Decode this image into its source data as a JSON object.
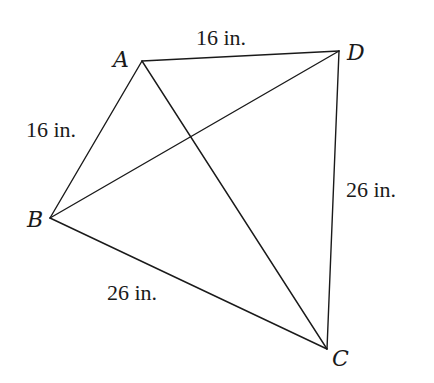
{
  "figure": {
    "type": "kite",
    "vertices": [
      {
        "id": "A",
        "label": "A",
        "x": 142,
        "y": 61,
        "label_x": 113,
        "label_y": 67
      },
      {
        "id": "B",
        "label": "B",
        "x": 50,
        "y": 218,
        "label_x": 27,
        "label_y": 227
      },
      {
        "id": "C",
        "label": "C",
        "x": 327,
        "y": 349,
        "label_x": 332,
        "label_y": 366
      },
      {
        "id": "D",
        "label": "D",
        "x": 339,
        "y": 51,
        "label_x": 347,
        "label_y": 60
      }
    ],
    "sides": [
      {
        "id": "AD",
        "from": "A",
        "to": "D",
        "length_label": "16 in.",
        "label_x": 196,
        "label_y": 45
      },
      {
        "id": "AB",
        "from": "A",
        "to": "B",
        "length_label": "16 in.",
        "label_x": 26,
        "label_y": 137
      },
      {
        "id": "DC",
        "from": "D",
        "to": "C",
        "length_label": "26 in.",
        "label_x": 346,
        "label_y": 197
      },
      {
        "id": "BC",
        "from": "B",
        "to": "C",
        "length_label": "26 in.",
        "label_x": 107,
        "label_y": 300
      }
    ],
    "diagonals": [
      {
        "id": "AC",
        "from": "A",
        "to": "C"
      },
      {
        "id": "BD",
        "from": "B",
        "to": "D"
      }
    ]
  }
}
